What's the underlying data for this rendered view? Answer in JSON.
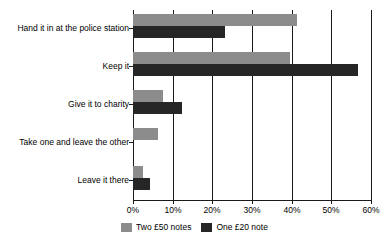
{
  "chart_data": {
    "type": "bar",
    "orientation": "horizontal",
    "title": "",
    "xlabel": "",
    "ylabel": "",
    "xlim": [
      0,
      60
    ],
    "xticks": [
      0,
      10,
      20,
      30,
      40,
      50,
      60
    ],
    "xtick_labels": [
      "0%",
      "10%",
      "20%",
      "30%",
      "40%",
      "50%",
      "60%"
    ],
    "grid": true,
    "legend_position": "bottom",
    "categories": [
      "Hand it in at the police station",
      "Keep it",
      "Give it to charity",
      "Take one and leave the other",
      "Leave it there"
    ],
    "series": [
      {
        "name": "Two £50 notes",
        "color": "#8c8c8c",
        "values": [
          41.3,
          39.5,
          7.5,
          6.4,
          2.5
        ]
      },
      {
        "name": "One £20 note",
        "color": "#262626",
        "values": [
          23.3,
          56.8,
          12.3,
          0,
          4.3
        ]
      }
    ]
  },
  "legend": {
    "items": [
      {
        "label": "Two £50 notes",
        "swatch": "series-0-swatch"
      },
      {
        "label": "One £20 note",
        "swatch": "series-1-swatch"
      }
    ]
  }
}
